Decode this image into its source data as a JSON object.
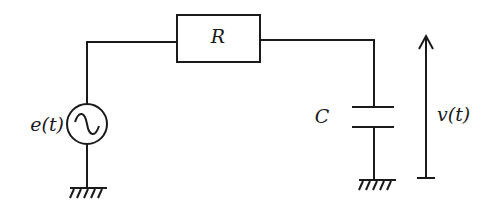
{
  "diagram": {
    "type": "RC circuit schematic",
    "labels": {
      "resistor": "R",
      "capacitor": "C",
      "source": "e(t)",
      "output_voltage": "v(t)"
    },
    "components": [
      {
        "id": "source",
        "kind": "AC voltage source",
        "label": "e(t)",
        "symbol": "~"
      },
      {
        "id": "resistor",
        "kind": "resistor",
        "label": "R"
      },
      {
        "id": "capacitor",
        "kind": "capacitor",
        "label": "C"
      },
      {
        "id": "ground-left",
        "kind": "ground"
      },
      {
        "id": "ground-right",
        "kind": "ground"
      },
      {
        "id": "voltage-arrow",
        "kind": "voltage arrow",
        "label": "v(t)",
        "direction": "up"
      }
    ],
    "connections": [
      [
        "ground-left",
        "source"
      ],
      [
        "source",
        "resistor"
      ],
      [
        "resistor",
        "capacitor"
      ],
      [
        "capacitor",
        "ground-right"
      ]
    ],
    "colors": {
      "line": "#1a1a1a",
      "background": "#ffffff"
    }
  }
}
